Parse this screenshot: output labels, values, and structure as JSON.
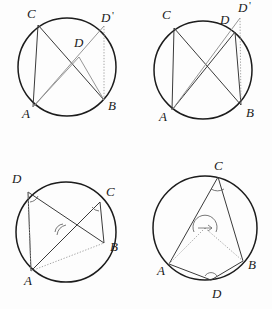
{
  "document": {
    "kind": "geometry-figure-sheet",
    "description": "Four circle-geometry diagrams illustrating the inscribed angle theorem",
    "background_color": "#fdfdfd",
    "ink_color": "#1c1c1c",
    "faint_ink_color": "#8a8a8a",
    "footer_text": ""
  },
  "figures": [
    {
      "id": "figure-top-left",
      "position": "top-left",
      "labels": [
        {
          "name": "A",
          "text": "A",
          "prime": "",
          "x": 22,
          "y": 118
        },
        {
          "name": "B",
          "text": "B",
          "prime": "",
          "x": 108,
          "y": 110
        },
        {
          "name": "C",
          "text": "C",
          "prime": "",
          "x": 27,
          "y": 18
        },
        {
          "name": "D",
          "text": "D",
          "prime": "",
          "x": 74,
          "y": 47
        },
        {
          "name": "Dprime",
          "text": "D",
          "prime": "'",
          "x": 101,
          "y": 22
        }
      ],
      "circle": {
        "cx": 67,
        "cy": 67,
        "r": 49
      },
      "points": {
        "A": [
          33,
          107
        ],
        "B": [
          104,
          100
        ],
        "C": [
          38,
          25
        ],
        "D": [
          79,
          57
        ],
        "Dprime": [
          104,
          26
        ]
      },
      "segments": [
        {
          "name": "chord-CA",
          "from": "C",
          "to": "A",
          "style": "solid"
        },
        {
          "name": "chord-CB",
          "from": "C",
          "to": "B",
          "style": "solid"
        },
        {
          "name": "chord-AD",
          "from": "A",
          "to": "D",
          "style": "faint"
        },
        {
          "name": "chord-DB",
          "from": "D",
          "to": "B",
          "style": "faint"
        },
        {
          "name": "chord-ADprime",
          "from": "A",
          "to": "Dprime",
          "style": "faint"
        },
        {
          "name": "chord-DprimeB",
          "from": "Dprime",
          "to": "B",
          "style": "dotted"
        }
      ],
      "angle_marks": []
    },
    {
      "id": "figure-top-right",
      "position": "top-right",
      "labels": [
        {
          "name": "A",
          "text": "A",
          "prime": "",
          "x": 23,
          "y": 121
        },
        {
          "name": "B",
          "text": "B",
          "prime": "",
          "x": 110,
          "y": 117
        },
        {
          "name": "C",
          "text": "C",
          "prime": "",
          "x": 26,
          "y": 19
        },
        {
          "name": "D",
          "text": "D",
          "prime": "",
          "x": 84,
          "y": 24
        },
        {
          "name": "Dprime",
          "text": "D",
          "prime": "'",
          "x": 102,
          "y": 10
        }
      ],
      "circle": {
        "cx": 67,
        "cy": 70,
        "r": 49
      },
      "points": {
        "A": [
          36,
          110
        ],
        "B": [
          105,
          105
        ],
        "C": [
          38,
          28
        ],
        "D": [
          99,
          32
        ],
        "Dprime": [
          104,
          18
        ]
      },
      "segments": [
        {
          "name": "chord-CA",
          "from": "C",
          "to": "A",
          "style": "solid"
        },
        {
          "name": "chord-CB",
          "from": "C",
          "to": "B",
          "style": "solid"
        },
        {
          "name": "chord-AD",
          "from": "A",
          "to": "D",
          "style": "solid"
        },
        {
          "name": "chord-DB",
          "from": "D",
          "to": "B",
          "style": "solid"
        },
        {
          "name": "chord-ADprime",
          "from": "A",
          "to": "Dprime",
          "style": "faint"
        },
        {
          "name": "chord-DprimeB",
          "from": "Dprime",
          "to": "B",
          "style": "dotted"
        }
      ],
      "angle_marks": []
    },
    {
      "id": "figure-bottom-left",
      "position": "bottom-left",
      "labels": [
        {
          "name": "A",
          "text": "A",
          "prime": "",
          "x": 24,
          "y": 130
        },
        {
          "name": "B",
          "text": "B",
          "prime": "",
          "x": 110,
          "y": 96
        },
        {
          "name": "C",
          "text": "C",
          "prime": "",
          "x": 106,
          "y": 41
        },
        {
          "name": "D",
          "text": "D",
          "prime": "",
          "x": 14,
          "y": 28
        }
      ],
      "circle": {
        "cx": 66,
        "cy": 77,
        "r": 50
      },
      "points": {
        "A": [
          31,
          116
        ],
        "B": [
          104,
          88
        ],
        "C": [
          100,
          47
        ],
        "D": [
          28,
          37
        ]
      },
      "segments": [
        {
          "name": "chord-DA",
          "from": "D",
          "to": "A",
          "style": "solid"
        },
        {
          "name": "chord-DB",
          "from": "D",
          "to": "B",
          "style": "solid"
        },
        {
          "name": "chord-AC",
          "from": "A",
          "to": "C",
          "style": "solid"
        },
        {
          "name": "chord-CB",
          "from": "C",
          "to": "B",
          "style": "solid"
        },
        {
          "name": "chord-AB-faint",
          "from": "A",
          "to": "B",
          "style": "dotted"
        },
        {
          "name": "chord-AD-faint",
          "from": "A",
          "to": "D",
          "style": "dotted"
        }
      ],
      "angle_marks": [
        {
          "name": "angle-at-D",
          "cx": 30,
          "cy": 40,
          "r": 7
        },
        {
          "name": "angle-at-C",
          "cx": 98,
          "cy": 50,
          "r": 7
        },
        {
          "name": "angle-at-intersection",
          "cx": 62,
          "cy": 72,
          "r": 8
        }
      ]
    },
    {
      "id": "figure-bottom-right",
      "position": "bottom-right",
      "labels": [
        {
          "name": "A",
          "text": "A",
          "prime": "",
          "x": 22,
          "y": 118
        },
        {
          "name": "B",
          "text": "B",
          "prime": "",
          "x": 113,
          "y": 112
        },
        {
          "name": "C",
          "text": "C",
          "prime": "",
          "x": 79,
          "y": 14
        },
        {
          "name": "D",
          "text": "D",
          "prime": "",
          "x": 80,
          "y": 143
        }
      ],
      "circle": {
        "cx": 69,
        "cy": 73,
        "r": 52
      },
      "points": {
        "A": [
          33,
          109
        ],
        "B": [
          107,
          106
        ],
        "C": [
          82,
          22
        ],
        "D": [
          75,
          125
        ],
        "O": [
          69,
          73
        ]
      },
      "segments": [
        {
          "name": "chord-CA",
          "from": "C",
          "to": "A",
          "style": "solid"
        },
        {
          "name": "chord-CB",
          "from": "C",
          "to": "B",
          "style": "solid"
        },
        {
          "name": "chord-DA",
          "from": "D",
          "to": "A",
          "style": "solid"
        },
        {
          "name": "chord-DB",
          "from": "D",
          "to": "B",
          "style": "solid"
        },
        {
          "name": "radius-OA",
          "from": "O",
          "to": "A",
          "style": "dotted"
        },
        {
          "name": "radius-OB",
          "from": "O",
          "to": "B",
          "style": "dotted"
        }
      ],
      "angle_marks": [
        {
          "name": "angle-at-C",
          "cx": 82,
          "cy": 27,
          "r": 7
        },
        {
          "name": "angle-at-center-O",
          "cx": 69,
          "cy": 68,
          "r": 12
        },
        {
          "name": "angle-at-D",
          "cx": 75,
          "cy": 122,
          "r": 6
        }
      ]
    }
  ]
}
